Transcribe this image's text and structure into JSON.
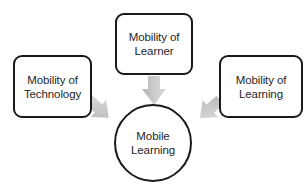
{
  "diagram": {
    "background_color": "#ffffff",
    "node_border_color": "#1a1a1a",
    "node_fill_color": "#ffffff",
    "text_color": "#262626",
    "arrow_color": "#c9c9c9",
    "arrow_shade_color": "#b0b0b0",
    "nodes": {
      "technology": {
        "label": "Mobility of\nTechnology",
        "shape": "rounded-rect"
      },
      "learner": {
        "label": "Mobility of\nLearner",
        "shape": "rounded-rect"
      },
      "learning": {
        "label": "Mobility of\nLearning",
        "shape": "rounded-rect"
      },
      "center": {
        "label": "Mobile\nLearning",
        "shape": "circle"
      }
    },
    "arrows": [
      {
        "name": "technology-to-center",
        "from": "technology",
        "to": "center",
        "direction": "down-right"
      },
      {
        "name": "learner-to-center",
        "from": "learner",
        "to": "center",
        "direction": "down"
      },
      {
        "name": "learning-to-center",
        "from": "learning",
        "to": "center",
        "direction": "down-left"
      }
    ]
  }
}
